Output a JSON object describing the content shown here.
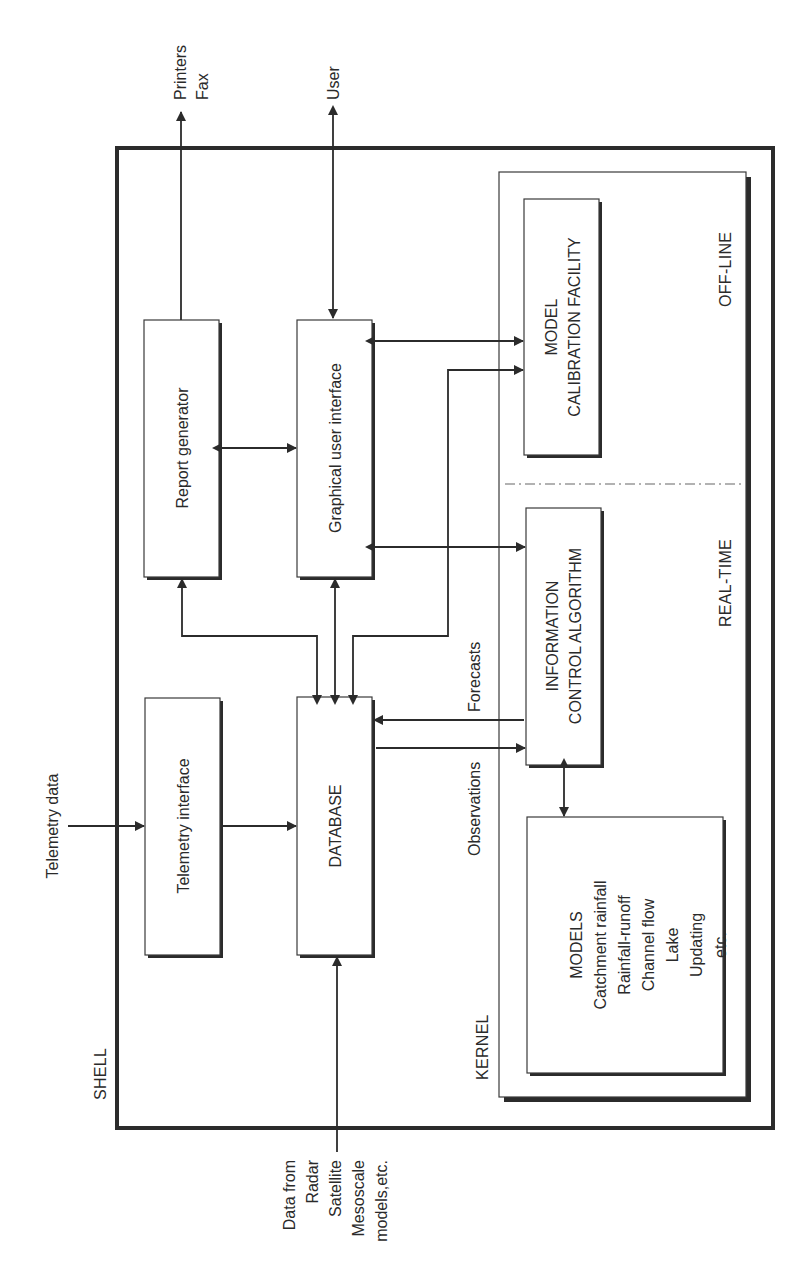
{
  "diagram": {
    "orientation": "rotated -90deg (text reads bottom-to-top)",
    "containers": {
      "shell": {
        "label": "SHELL"
      },
      "kernel": {
        "label": "KERNEL"
      },
      "real_time": {
        "label": "REAL-TIME"
      },
      "off_line": {
        "label": "OFF-LINE"
      }
    },
    "boxes": {
      "report_generator": {
        "label": "Report generator"
      },
      "gui": {
        "label": "Graphical user interface"
      },
      "telemetry_interface": {
        "label": "Telemetry interface"
      },
      "database": {
        "label": "DATABASE"
      },
      "calibration": {
        "line1": "MODEL",
        "line2": "CALIBRATION FACILITY"
      },
      "info_control": {
        "line1": "INFORMATION",
        "line2": "CONTROL ALGORITHM"
      },
      "models": {
        "lines": [
          "MODELS",
          "Catchment rainfall",
          "Rainfall-runoff",
          "Channel flow",
          "Lake",
          "Updating",
          "etc."
        ]
      }
    },
    "external": {
      "printers": {
        "line1": "Printers",
        "line2": "Fax"
      },
      "user": {
        "label": "User"
      },
      "telemetry_data": {
        "label": "Telemetry data"
      },
      "data_from": {
        "lines": [
          "Data from",
          "Radar",
          "Satellite",
          "Mesoscale",
          "models,etc."
        ]
      }
    },
    "flow_labels": {
      "forecasts": "Forecasts",
      "observations": "Observations"
    },
    "connections": [
      {
        "from": "Report generator",
        "to": "Printers/Fax",
        "direction": "out"
      },
      {
        "from": "User",
        "to": "Graphical user interface",
        "direction": "bidirectional"
      },
      {
        "from": "Report generator",
        "to": "Graphical user interface",
        "direction": "bidirectional"
      },
      {
        "from": "Graphical user interface",
        "to": "MODEL CALIBRATION FACILITY",
        "direction": "bidirectional"
      },
      {
        "from": "Graphical user interface",
        "to": "INFORMATION CONTROL ALGORITHM",
        "direction": "bidirectional"
      },
      {
        "from": "DATABASE",
        "to": "Report generator",
        "direction": "bidirectional"
      },
      {
        "from": "DATABASE",
        "to": "Graphical user interface",
        "direction": "bidirectional"
      },
      {
        "from": "DATABASE",
        "to": "MODEL CALIBRATION FACILITY",
        "direction": "bidirectional"
      },
      {
        "from": "Telemetry data",
        "to": "Telemetry interface",
        "direction": "in"
      },
      {
        "from": "Telemetry interface",
        "to": "DATABASE",
        "direction": "in"
      },
      {
        "from": "Data from Radar/Satellite/Mesoscale models",
        "to": "DATABASE",
        "direction": "in"
      },
      {
        "from": "INFORMATION CONTROL ALGORITHM",
        "to": "DATABASE",
        "label": "Forecasts"
      },
      {
        "from": "DATABASE",
        "to": "INFORMATION CONTROL ALGORITHM",
        "label": "Observations"
      },
      {
        "from": "INFORMATION CONTROL ALGORITHM",
        "to": "MODELS",
        "direction": "bidirectional"
      }
    ]
  }
}
